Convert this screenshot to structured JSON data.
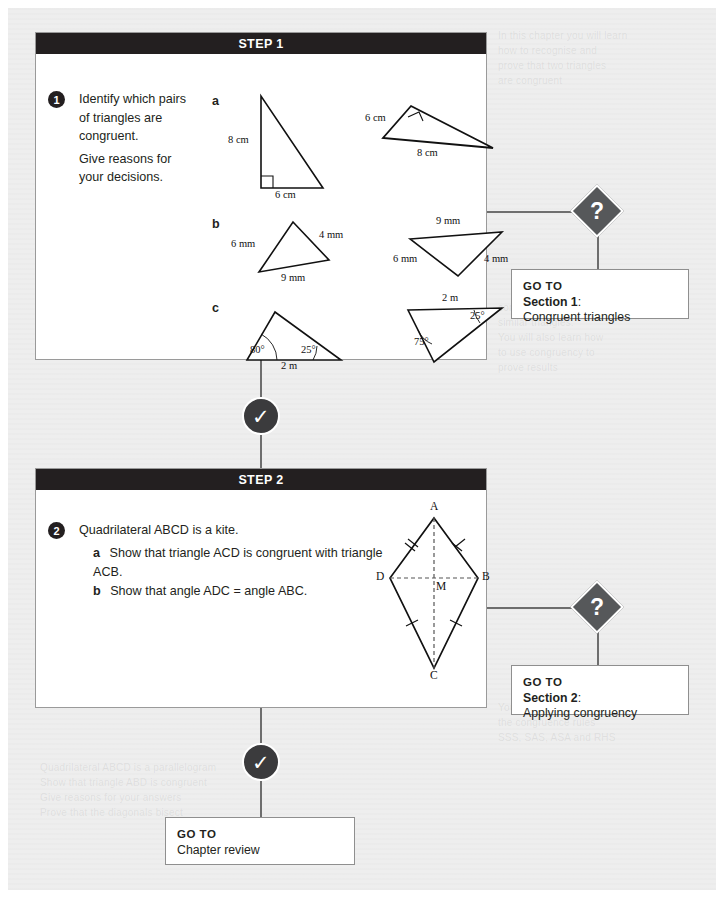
{
  "page": {
    "background_color": "#eeeeee",
    "accent_dark": "#231f20",
    "marker_gray": "#56585a",
    "connector_gray": "#6e6e6e"
  },
  "ghost_text": {
    "top": "In this chapter you will learn\nhow to recognise and\nprove that two triangles\nare congruent",
    "middle": "congruent triangles and\nsimilar triangles.\nYou will also learn how\nto use congruency to\nprove results",
    "lower": "You will be able to use\nthe congruence rules\nSSS, SAS, ASA and RHS",
    "left": "Quadrilateral ABCD is a parallelogram\nShow that triangle ABD is congruent\nGive reasons for your answers\nProve that the diagonals bisect"
  },
  "steps": [
    {
      "header": "STEP 1",
      "number": "1",
      "prompt_lines": [
        "Identify which pairs",
        "of triangles are",
        "congruent.",
        "Give reasons for",
        "your decisions."
      ],
      "parts": [
        {
          "letter": "a",
          "figures": [
            {
              "name": "right-triangle-vertical",
              "labels": [
                "8 cm",
                "6 cm"
              ],
              "right_angle": true
            },
            {
              "name": "right-triangle-rotated",
              "labels": [
                "6 cm",
                "8 cm"
              ],
              "right_angle": true
            }
          ]
        },
        {
          "letter": "b",
          "figures": [
            {
              "name": "scalene-triangle-left",
              "labels": [
                "6 mm",
                "4 mm",
                "9 mm"
              ],
              "right_angle": false
            },
            {
              "name": "scalene-triangle-right",
              "labels": [
                "9 mm",
                "6 mm",
                "4 mm"
              ],
              "right_angle": false
            }
          ]
        },
        {
          "letter": "c",
          "figures": [
            {
              "name": "angle-triangle-left",
              "labels": [
                "80°",
                "25°",
                "2 m"
              ],
              "right_angle": false
            },
            {
              "name": "angle-triangle-right",
              "labels": [
                "2 m",
                "25°",
                "75°"
              ],
              "right_angle": false
            }
          ]
        }
      ]
    },
    {
      "header": "STEP 2",
      "number": "2",
      "prompt_lines": [
        "Quadrilateral ABCD is a kite."
      ],
      "sub_questions": [
        {
          "letter": "a",
          "text": "Show that triangle ACD is congruent with triangle ACB."
        },
        {
          "letter": "b",
          "text": "Show that angle ADC = angle ABC."
        }
      ],
      "figure": {
        "name": "kite-ABCD",
        "vertices": [
          "A",
          "B",
          "C",
          "D",
          "M"
        ],
        "tick_marks": {
          "upper": 2,
          "lower": 1
        }
      }
    }
  ],
  "markers": {
    "question_glyph": "?",
    "check_glyph": "✓"
  },
  "goto_boxes": [
    {
      "head": "GO TO",
      "section": "Section 1",
      "colon": ":",
      "description": "Congruent triangles"
    },
    {
      "head": "GO TO",
      "section": "Section 2",
      "colon": ":",
      "description": "Applying congruency"
    },
    {
      "head": "GO TO",
      "section": "",
      "colon": "",
      "description": "Chapter review"
    }
  ]
}
